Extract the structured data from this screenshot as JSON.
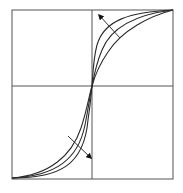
{
  "diagram": {
    "type": "sigmoid-family",
    "frame": {
      "x0": 12,
      "y0": 10,
      "x1": 173,
      "y1": 179
    },
    "center": {
      "x": 92,
      "y": 86
    },
    "colors": {
      "stroke": "#2a2a2a",
      "axis": "#555555",
      "background": "#ffffff"
    },
    "curves": [
      {
        "name": "curve-steep",
        "path": "M12 178 C 60 178, 84 165, 88 120 C 91 100, 91 95, 92 86 C 93 75, 93 60, 97 45 C 104 20, 130 12, 173 10"
      },
      {
        "name": "curve-mid",
        "path": "M12 178 C 55 176, 78 160, 85 125 C 89 105, 90 95, 92 86 C 94 76, 96 64, 102 50 C 112 25, 140 14, 173 10"
      },
      {
        "name": "curve-shallow",
        "path": "M12 178 C 50 175, 72 155, 81 128 C 87 110, 89 96, 92 86 C 95 75, 99 65, 108 52 C 122 30, 150 16, 173 10"
      }
    ],
    "arrows": [
      {
        "name": "upper-arrow",
        "from": {
          "x": 120,
          "y": 38
        },
        "to": {
          "x": 99,
          "y": 15
        }
      },
      {
        "name": "lower-arrow",
        "from": {
          "x": 68,
          "y": 136
        },
        "to": {
          "x": 91,
          "y": 158
        }
      }
    ]
  }
}
